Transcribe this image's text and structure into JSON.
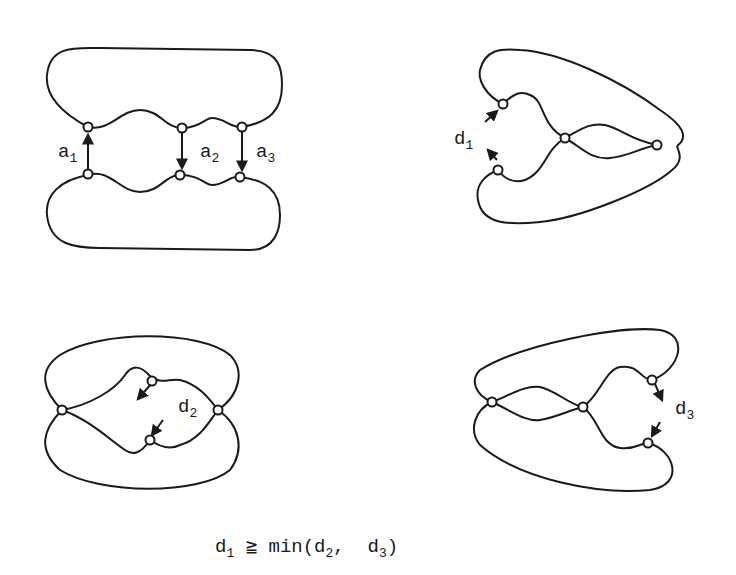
{
  "figures": [
    {
      "id": "original",
      "labels": [
        {
          "base": "a",
          "sub": "1"
        },
        {
          "base": "a",
          "sub": "2"
        },
        {
          "base": "a",
          "sub": "3"
        }
      ]
    },
    {
      "id": "d1-config",
      "labels": [
        {
          "base": "d",
          "sub": "1"
        }
      ]
    },
    {
      "id": "d2-config",
      "labels": [
        {
          "base": "d",
          "sub": "2"
        }
      ]
    },
    {
      "id": "d3-config",
      "labels": [
        {
          "base": "d",
          "sub": "3"
        }
      ]
    }
  ],
  "formula": {
    "lhs_base": "d",
    "lhs_sub": "1",
    "relation": "≧",
    "func": "min(",
    "arg1_base": "d",
    "arg1_sub": "2",
    "sep": ",  ",
    "arg2_base": "d",
    "arg2_sub": "3",
    "close": ")"
  },
  "colors": {
    "stroke": "#1a1a1a",
    "background": "#ffffff"
  }
}
